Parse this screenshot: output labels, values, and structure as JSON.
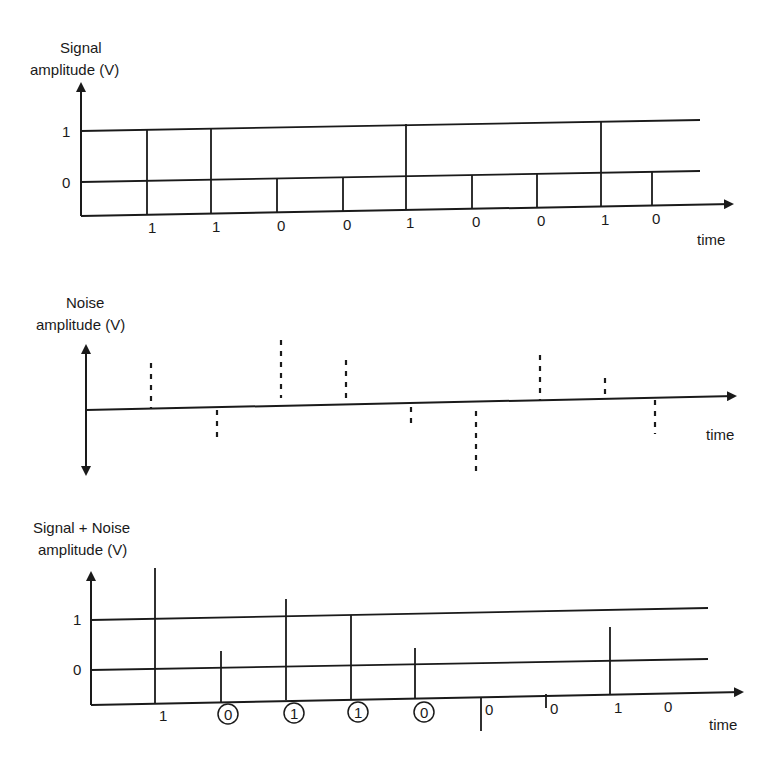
{
  "panels": {
    "signal": {
      "ylabel_line1": "Signal",
      "ylabel_line2": "amplitude (V)",
      "level_high": "1",
      "level_low": "0",
      "xlabel": "time",
      "bits": [
        "1",
        "1",
        "0",
        "0",
        "1",
        "0",
        "0",
        "1",
        "0"
      ]
    },
    "noise": {
      "ylabel_line1": "Noise",
      "ylabel_line2": "amplitude (V)",
      "xlabel": "time",
      "samples": [
        "+",
        "-",
        "++",
        "+",
        "-",
        "--",
        "+",
        "+small",
        "-"
      ]
    },
    "sum": {
      "ylabel_line1": "Signal + Noise",
      "ylabel_line2": "amplitude (V)",
      "level_high": "1",
      "level_low": "0",
      "xlabel": "time",
      "bits": [
        "1",
        "0",
        "1",
        "1",
        "0",
        "0",
        "0",
        "1",
        "0"
      ],
      "errors_circled": [
        false,
        true,
        true,
        true,
        true,
        false,
        false,
        false,
        false
      ]
    }
  }
}
